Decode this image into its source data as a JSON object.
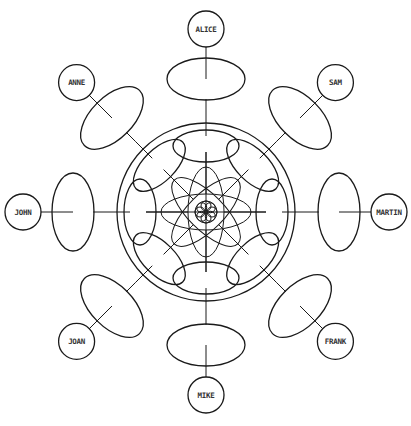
{
  "diagram": {
    "title": "",
    "type": "radial-network",
    "colors": {
      "line": "#1a1a1a",
      "label": "#333333",
      "background": "#ffffff"
    },
    "spoke_count": 8,
    "nodes": [
      {
        "id": "alice",
        "label": "ALICE",
        "direction": "top"
      },
      {
        "id": "sam",
        "label": "SAM",
        "direction": "top-right"
      },
      {
        "id": "martin",
        "label": "MARTIN",
        "direction": "right"
      },
      {
        "id": "frank",
        "label": "FRANK",
        "direction": "bottom-right"
      },
      {
        "id": "mike",
        "label": "MIKE",
        "direction": "bottom"
      },
      {
        "id": "joan",
        "label": "JOAN",
        "direction": "bottom-left"
      },
      {
        "id": "john",
        "label": "JOHN",
        "direction": "left"
      },
      {
        "id": "anne",
        "label": "ANNE",
        "direction": "top-left"
      }
    ]
  }
}
